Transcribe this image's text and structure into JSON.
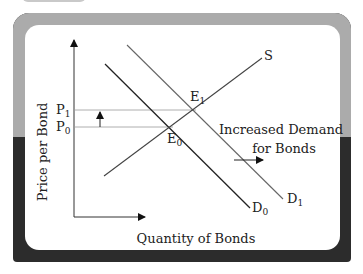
{
  "diagram": {
    "title": "Increased Demand for Bonds",
    "axes": {
      "y_label": "Price per Bond",
      "x_label": "Quantity of Bonds"
    },
    "price_levels": [
      {
        "label": "P",
        "sub": "1"
      },
      {
        "label": "P",
        "sub": "0"
      }
    ],
    "curves": {
      "supply": "S",
      "demand_initial": {
        "label": "D",
        "sub": "0"
      },
      "demand_new": {
        "label": "D",
        "sub": "1"
      }
    },
    "equilibria": [
      {
        "label": "E",
        "sub": "1"
      },
      {
        "label": "E",
        "sub": "0"
      }
    ],
    "annotation": {
      "line1": "Increased Demand",
      "line2": "for Bonds"
    },
    "colors": {
      "frame_top": "#ababab",
      "frame_bottom": "#2c2c2c",
      "panel": "#ffffff",
      "demand_initial": "#2a2a2a",
      "demand_new": "#555555",
      "supply": "#444444",
      "guide_lines": "#888888"
    }
  }
}
